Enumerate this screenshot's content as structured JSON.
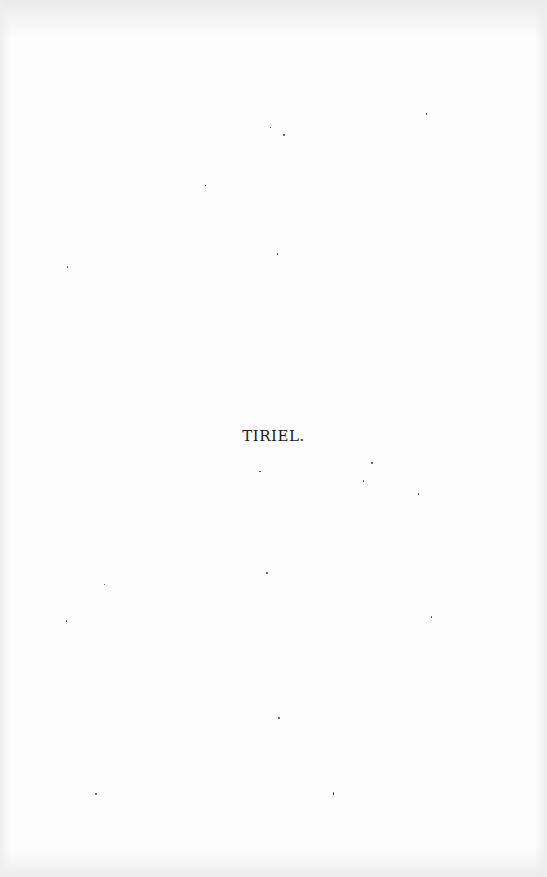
{
  "page": {
    "title": "TIRIEL.",
    "background_color": "#fdfdfd",
    "text_color": "#1a1a1a"
  }
}
